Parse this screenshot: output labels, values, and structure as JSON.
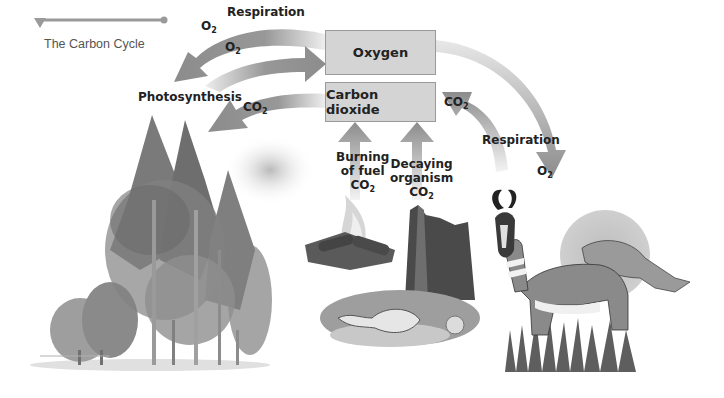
{
  "header": {
    "title": "The Carbon Cycle"
  },
  "boxes": {
    "oxygen": "Oxygen",
    "carbon_dioxide": "Carbon dioxide"
  },
  "labels": {
    "respiration_top": "Respiration",
    "o2_top_left": "O",
    "o2_middle": "O",
    "photosynthesis": "Photosynthesis",
    "co2_left": "CO",
    "co2_right": "CO",
    "respiration_right": "Respiration",
    "o2_right": "O",
    "burning_line1": "Burning",
    "burning_line2": "of fuel",
    "burning_co2": "CO",
    "decaying_line1": "Decaying",
    "decaying_line2": "organism",
    "decaying_co2": "CO",
    "subscript": "2"
  },
  "illustrations": {
    "trees": "forest-trees",
    "fire": "burning-campfire",
    "stump": "decaying-stump-with-skull",
    "animals": "pronghorn-antelopes"
  },
  "colors": {
    "arrow": "#8c8c8c",
    "box_fill": "#d4d4d4",
    "box_border": "#9a9a9a",
    "text": "#222222"
  }
}
